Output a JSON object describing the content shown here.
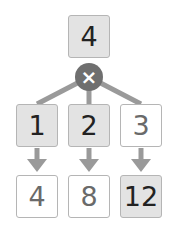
{
  "colors": {
    "connector": "#9a9a9a",
    "operator_bg": "#6f6f6f",
    "shaded_box": "#e3e3e3",
    "plain_box": "#ffffff"
  },
  "top": {
    "value": "4"
  },
  "operator": {
    "symbol": "×",
    "icon": "multiply-icon"
  },
  "factors": [
    {
      "value": "1",
      "shaded": true
    },
    {
      "value": "2",
      "shaded": true
    },
    {
      "value": "3",
      "shaded": false
    }
  ],
  "products": [
    {
      "value": "4",
      "shaded": false
    },
    {
      "value": "8",
      "shaded": false
    },
    {
      "value": "12",
      "shaded": true
    }
  ]
}
